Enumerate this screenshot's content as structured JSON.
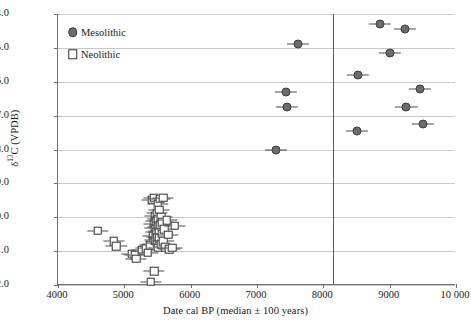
{
  "chart_data": {
    "type": "scatter",
    "title": "",
    "xlabel": "Date cal BP (median ± 100 years)",
    "ylabel": "δ¹³C (VPDB)",
    "xlim": [
      4000,
      10000
    ],
    "ylim": [
      -22.0,
      -14.0
    ],
    "xticks": [
      "4000",
      "5000",
      "6000",
      "7000",
      "8000",
      "9000",
      "10 000"
    ],
    "xtick_values": [
      4000,
      5000,
      6000,
      7000,
      8000,
      9000,
      10000
    ],
    "yticks": [
      "−14.0",
      "−15.0",
      "−16.0",
      "−17.0",
      "−18.0",
      "−19.0",
      "−20.0",
      "−21.0",
      "−22.0"
    ],
    "ytick_values": [
      -14,
      -15,
      -16,
      -17,
      -18,
      -19,
      -20,
      -21,
      -22
    ],
    "grid": "horizontal",
    "legend_position": "top-left",
    "annotations": [
      {
        "name": "period-boundary",
        "type": "vline",
        "x": 8150,
        "color": "#5a5a5a"
      }
    ],
    "error_bars": {
      "x_error": 100,
      "note": "median ± 100 years"
    },
    "series": [
      {
        "name": "Mesolithic",
        "marker": "filled-circle",
        "color": "#6b6b6b",
        "edge_color": "#3d3d3d",
        "points": [
          {
            "x": 7280,
            "y": -18.0
          },
          {
            "x": 7430,
            "y": -16.3
          },
          {
            "x": 7450,
            "y": -16.75
          },
          {
            "x": 7620,
            "y": -14.9
          },
          {
            "x": 8500,
            "y": -17.45
          },
          {
            "x": 8520,
            "y": -15.8
          },
          {
            "x": 8850,
            "y": -14.3
          },
          {
            "x": 9000,
            "y": -15.15
          },
          {
            "x": 9230,
            "y": -14.45
          },
          {
            "x": 9250,
            "y": -16.75
          },
          {
            "x": 9450,
            "y": -16.2
          },
          {
            "x": 9500,
            "y": -17.25
          }
        ]
      },
      {
        "name": "Neolithic",
        "marker": "open-square",
        "color": "#ffffff",
        "edge_color": "#2e2e2e",
        "points": [
          {
            "x": 4600,
            "y": -20.4
          },
          {
            "x": 4840,
            "y": -20.7
          },
          {
            "x": 4880,
            "y": -20.85
          },
          {
            "x": 5110,
            "y": -21.08
          },
          {
            "x": 5160,
            "y": -21.12
          },
          {
            "x": 5175,
            "y": -21.22
          },
          {
            "x": 5270,
            "y": -20.98
          },
          {
            "x": 5330,
            "y": -20.92
          },
          {
            "x": 5350,
            "y": -21.05
          },
          {
            "x": 5390,
            "y": -20.82
          },
          {
            "x": 5400,
            "y": -21.9
          },
          {
            "x": 5420,
            "y": -19.48
          },
          {
            "x": 5430,
            "y": -20.55
          },
          {
            "x": 5440,
            "y": -20.2
          },
          {
            "x": 5445,
            "y": -19.42
          },
          {
            "x": 5450,
            "y": -21.6
          },
          {
            "x": 5455,
            "y": -20.68
          },
          {
            "x": 5460,
            "y": -20.32
          },
          {
            "x": 5465,
            "y": -19.95
          },
          {
            "x": 5470,
            "y": -20.45
          },
          {
            "x": 5480,
            "y": -20.12
          },
          {
            "x": 5485,
            "y": -20.75
          },
          {
            "x": 5490,
            "y": -19.88
          },
          {
            "x": 5495,
            "y": -20.58
          },
          {
            "x": 5500,
            "y": -20.28
          },
          {
            "x": 5505,
            "y": -19.6
          },
          {
            "x": 5510,
            "y": -20.9
          },
          {
            "x": 5515,
            "y": -20.05
          },
          {
            "x": 5520,
            "y": -20.4
          },
          {
            "x": 5525,
            "y": -19.78
          },
          {
            "x": 5530,
            "y": -20.62
          },
          {
            "x": 5540,
            "y": -19.45
          },
          {
            "x": 5545,
            "y": -20.22
          },
          {
            "x": 5550,
            "y": -20.8
          },
          {
            "x": 5560,
            "y": -19.98
          },
          {
            "x": 5565,
            "y": -20.48
          },
          {
            "x": 5575,
            "y": -20.15
          },
          {
            "x": 5585,
            "y": -19.42
          },
          {
            "x": 5590,
            "y": -20.7
          },
          {
            "x": 5600,
            "y": -20.35
          },
          {
            "x": 5620,
            "y": -20.88
          },
          {
            "x": 5640,
            "y": -20.08
          },
          {
            "x": 5660,
            "y": -20.52
          },
          {
            "x": 5680,
            "y": -20.95
          },
          {
            "x": 5720,
            "y": -20.9
          },
          {
            "x": 5760,
            "y": -20.25
          }
        ]
      }
    ]
  },
  "legend": {
    "items": [
      {
        "label": "Mesolithic",
        "marker": "filled-circle"
      },
      {
        "label": "Neolithic",
        "marker": "open-square"
      }
    ]
  }
}
